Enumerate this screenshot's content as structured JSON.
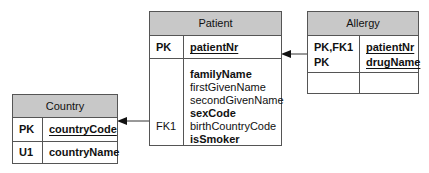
{
  "entities": {
    "patient": {
      "title": "Patient",
      "pk_row": {
        "key": "PK",
        "attr": "patientNr"
      },
      "attr_row": {
        "keys": [
          "",
          "",
          "",
          "",
          "FK1",
          ""
        ],
        "attrs": [
          {
            "name": "familyName",
            "bold": true
          },
          {
            "name": "firstGivenName",
            "bold": false
          },
          {
            "name": "secondGivenName",
            "bold": false
          },
          {
            "name": "sexCode",
            "bold": true
          },
          {
            "name": "birthCountryCode",
            "bold": false
          },
          {
            "name": "isSmoker",
            "bold": true
          }
        ]
      }
    },
    "allergy": {
      "title": "Allergy",
      "pk_row": {
        "keys": [
          "PK,FK1",
          "PK"
        ],
        "attrs": [
          "patientNr",
          "drugName"
        ]
      }
    },
    "country": {
      "title": "Country",
      "pk_row": {
        "key": "PK",
        "attr": "countryCode"
      },
      "u_row": {
        "key": "U1",
        "attr": "countryName"
      }
    }
  },
  "relationships": [
    {
      "from": "Allergy.patientNr",
      "to": "Patient.patientNr",
      "label": "FK1"
    },
    {
      "from": "Patient.birthCountryCode",
      "to": "Country.countryCode",
      "label": "FK1"
    }
  ],
  "colors": {
    "header_fill": "#c8c8c8",
    "border": "#555555"
  }
}
